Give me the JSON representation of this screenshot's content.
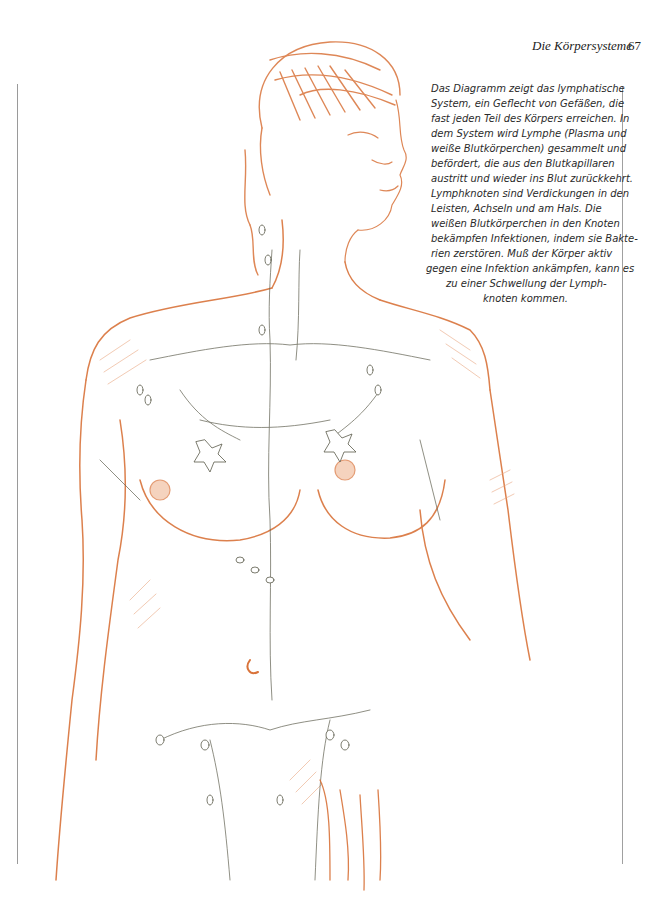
{
  "header": {
    "running_title": "Die Körpersysteme",
    "page_number": "67"
  },
  "caption": {
    "lines": [
      "Das Diagramm zeigt das lymphatische",
      "System, ein Geflecht von Gefäßen, die",
      "fast jeden Teil des Körpers erreichen. In",
      "dem System wird Lymphe (Plasma und",
      "weiße Blutkörperchen) gesammelt und",
      "befördert, die aus den Blutkapillaren",
      "austritt und wieder ins Blut zurückkehrt.",
      "Lymphknoten sind Verdickungen in den",
      "Leisten, Achseln und am Hals. Die",
      "weißen Blutkörperchen in den Knoten",
      "bekämpfen Infektionen, indem sie Bakte-",
      "rien zerstören. Muß der Körper aktiv",
      "gegen eine Infektion ankämpfen, kann es",
      "zu einer Schwellung der Lymph-",
      "knoten kommen."
    ]
  },
  "figure": {
    "colors": {
      "body_sketch": "#d9733a",
      "body_hatching": "#e8a27a",
      "lymph_vessels": "#5b5a4a",
      "rules": "#9a9a9a",
      "text": "#2a2a2a"
    }
  }
}
